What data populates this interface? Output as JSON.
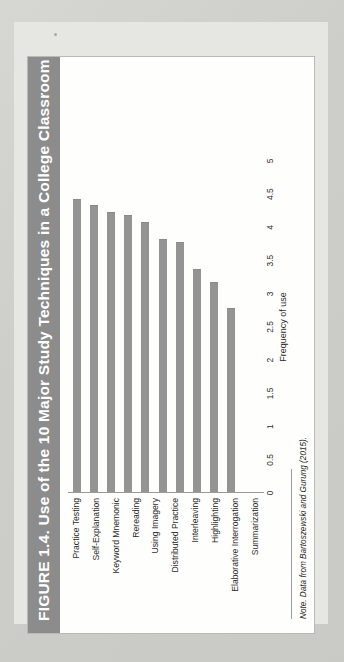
{
  "figure": {
    "title": "FIGURE 1.4. Use of the 10 Major Study Techniques in a College Classroom",
    "note_lead": "Note.",
    "note_text": " Data from Bartoszewski and Gurung (2015).",
    "note_full": "Note. Data from Bartoszewski and Gurung (2015).",
    "band_color": "#8c8c8c",
    "bar_color": "#949494",
    "page_color": "#e6e6e3"
  },
  "chart_data": {
    "type": "bar",
    "orientation": "horizontal",
    "title": "FIGURE 1.4. Use of the 10 Major Study Techniques in a College Classroom",
    "xlabel": "Frequency of use",
    "ylabel": "",
    "xlim": [
      0,
      5
    ],
    "grid": false,
    "legend": false,
    "xticks": [
      "0",
      "0.5",
      "1",
      "1.5",
      "2",
      "2.5",
      "3",
      "3.5",
      "4",
      "4.5",
      "5"
    ],
    "xtick_values": [
      0,
      0.5,
      1,
      1.5,
      2,
      2.5,
      3,
      3.5,
      4,
      4.5,
      5
    ],
    "categories": [
      "Practice Testing",
      "Self-Explanation",
      "Keyword Mnemonic",
      "Rereading",
      "Using Imagery",
      "Distributed Practice",
      "Interleaving",
      "Highlighting",
      "Elaborative Interrogation",
      "Summarization"
    ],
    "values": [
      4.4,
      4.3,
      4.2,
      4.15,
      4.05,
      3.8,
      3.75,
      3.35,
      3.15,
      2.75
    ]
  }
}
